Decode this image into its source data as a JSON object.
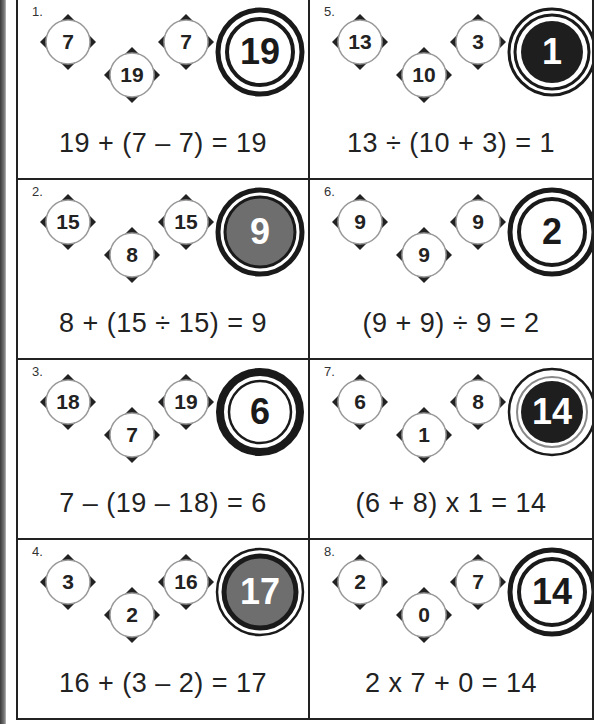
{
  "worksheet": {
    "puzzles": [
      {
        "label": "1.",
        "numbers": [
          "7",
          "19",
          "7"
        ],
        "answer": "19",
        "answer_style": "white",
        "equation": "19 + (7 – 7) = 19"
      },
      {
        "label": "2.",
        "numbers": [
          "15",
          "8",
          "15"
        ],
        "answer": "9",
        "answer_style": "gray",
        "equation": "8 + (15 ÷ 15) = 9"
      },
      {
        "label": "3.",
        "numbers": [
          "18",
          "7",
          "19"
        ],
        "answer": "6",
        "answer_style": "white-thick",
        "equation": "7 – (19 – 18) = 6"
      },
      {
        "label": "4.",
        "numbers": [
          "3",
          "2",
          "16"
        ],
        "answer": "17",
        "answer_style": "gray-outer-ring",
        "equation": "16 + (3 – 2) = 17"
      },
      {
        "label": "5.",
        "numbers": [
          "13",
          "10",
          "3"
        ],
        "answer": "1",
        "answer_style": "black",
        "equation": "13 ÷ (10 + 3) = 1"
      },
      {
        "label": "6.",
        "numbers": [
          "9",
          "9",
          "9"
        ],
        "answer": "2",
        "answer_style": "white",
        "equation": "(9 + 9) ÷ 9 = 2"
      },
      {
        "label": "7.",
        "numbers": [
          "6",
          "1",
          "8"
        ],
        "answer": "14",
        "answer_style": "black-outer-ring",
        "equation": "(6 + 8) x 1 = 14"
      },
      {
        "label": "8.",
        "numbers": [
          "2",
          "0",
          "7"
        ],
        "answer": "14",
        "answer_style": "white",
        "equation": "2 x 7 + 0 = 14"
      }
    ]
  },
  "colors": {
    "ink": "#1a1a1a",
    "gray_fill": "#6e6e6e",
    "black_fill": "#1e1e1e",
    "paper": "#ffffff"
  }
}
